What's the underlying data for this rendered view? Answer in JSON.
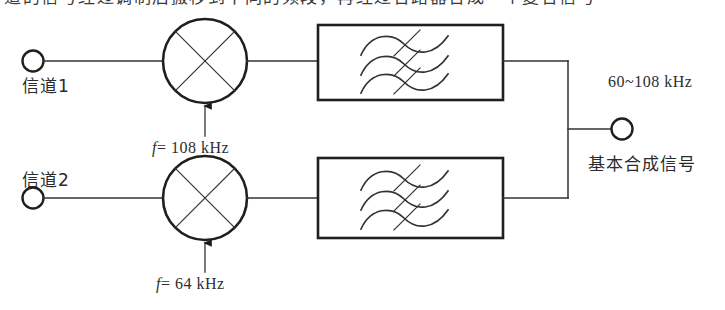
{
  "page": {
    "kind": "scanned-textbook-figure",
    "background_color": "#ffffff",
    "ink_color": "#1a1a1a",
    "width": 725,
    "height": 310
  },
  "cropped_text_top": {
    "text": "道的信号经过调制后搬移到不同的频段，再经过合路器合成一个复合信号"
  },
  "inputs": [
    {
      "name": "channel-1",
      "label": "信道1",
      "terminal": "open-circle"
    },
    {
      "name": "channel-2",
      "label": "信道2",
      "terminal": "open-circle"
    }
  ],
  "mixers": [
    {
      "name": "mixer-top",
      "symbol": "circle-with-x",
      "carrier_label_prefix": "f",
      "carrier_label": "f = 108 kHz",
      "carrier_value": "108",
      "carrier_unit": "kHz"
    },
    {
      "name": "mixer-bottom",
      "symbol": "circle-with-x",
      "carrier_label_prefix": "f",
      "carrier_label": "f = 64 kHz",
      "carrier_value": "64",
      "carrier_unit": "kHz"
    }
  ],
  "filters": [
    {
      "name": "bandpass-filter-top",
      "symbol": "three-crossed-sine-waves"
    },
    {
      "name": "bandpass-filter-bottom",
      "symbol": "three-crossed-sine-waves"
    }
  ],
  "output": {
    "band_label": "60~108 kHz",
    "signal_label": "基本合成信号",
    "terminal": "open-circle"
  },
  "carrier_math": {
    "top_prefix": "f",
    "top_equals": "= 108 kHz",
    "bottom_prefix": "f",
    "bottom_equals": "= 64 kHz"
  }
}
